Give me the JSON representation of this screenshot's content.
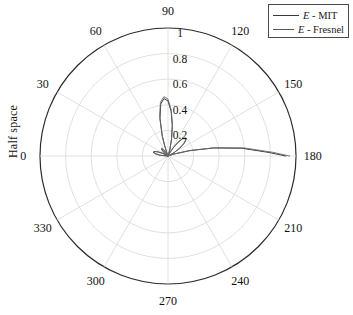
{
  "axes": {
    "ylabel": "Half space",
    "angle_ticks": [
      "0",
      "30",
      "60",
      "90",
      "120",
      "150",
      "180",
      "210",
      "240",
      "270",
      "300",
      "330"
    ],
    "radial_ticks": [
      "0.2",
      "0.4",
      "0.6",
      "0.8",
      "1"
    ]
  },
  "legend": {
    "items": [
      {
        "name": "E - MIT",
        "prefix": "E",
        "suffix": " - MIT",
        "color": "#3a3a3a"
      },
      {
        "name": "E - Fresnel",
        "prefix": "E",
        "suffix": " - Fresnel",
        "color": "#555555"
      }
    ]
  },
  "colors": {
    "outer_circle": "#2a2a2a",
    "grid": "#d8d8d8",
    "curve_mit": "#3a3a3a",
    "curve_fresnel": "#6a6a6a",
    "text": "#111111",
    "background": "#ffffff"
  },
  "chart_data": {
    "type": "line",
    "coordinate_system": "polar",
    "title": "",
    "xlabel": "",
    "ylabel": "Half space",
    "rlim": [
      0,
      1
    ],
    "r_ticks": [
      0.2,
      0.4,
      0.6,
      0.8,
      1.0
    ],
    "theta_ticks_deg": [
      0,
      30,
      60,
      90,
      120,
      150,
      180,
      210,
      240,
      270,
      300,
      330
    ],
    "theta_direction": "counterclockwise",
    "theta_zero_location": "W",
    "grid": true,
    "legend_position": "top-right",
    "series": [
      {
        "name": "E - MIT",
        "color": "#3a3a3a",
        "theta_deg": [
          0,
          5,
          10,
          14,
          18,
          22,
          26,
          30,
          34,
          38,
          42,
          46,
          50,
          54,
          58,
          62,
          66,
          70,
          72,
          74,
          78,
          82,
          86,
          90,
          94,
          98,
          102,
          106,
          110,
          114,
          118,
          122,
          126,
          130,
          134,
          138,
          142,
          146,
          150,
          154,
          158,
          160,
          162,
          166,
          170,
          174,
          178,
          180
        ],
        "r": [
          0.0,
          0.06,
          0.1,
          0.12,
          0.115,
          0.09,
          0.05,
          0.015,
          0.0,
          0.02,
          0.05,
          0.07,
          0.075,
          0.06,
          0.035,
          0.01,
          0.0,
          0.03,
          0.08,
          0.16,
          0.3,
          0.41,
          0.45,
          0.43,
          0.35,
          0.24,
          0.13,
          0.05,
          0.01,
          0.0,
          0.02,
          0.07,
          0.13,
          0.175,
          0.19,
          0.185,
          0.155,
          0.11,
          0.06,
          0.02,
          0.0,
          0.01,
          0.05,
          0.17,
          0.36,
          0.58,
          0.79,
          0.92
        ]
      },
      {
        "name": "E - Fresnel",
        "color": "#6a6a6a",
        "theta_deg": [
          0,
          5,
          10,
          14,
          18,
          22,
          26,
          30,
          34,
          38,
          42,
          46,
          50,
          54,
          58,
          62,
          66,
          70,
          72,
          74,
          78,
          82,
          86,
          90,
          94,
          98,
          102,
          106,
          110,
          114,
          118,
          122,
          126,
          130,
          134,
          138,
          142,
          146,
          150,
          154,
          158,
          160,
          162,
          166,
          170,
          174,
          178,
          180
        ],
        "r": [
          0.0,
          0.055,
          0.095,
          0.115,
          0.11,
          0.085,
          0.048,
          0.012,
          0.0,
          0.022,
          0.052,
          0.072,
          0.078,
          0.062,
          0.036,
          0.012,
          0.0,
          0.032,
          0.085,
          0.17,
          0.315,
          0.425,
          0.465,
          0.445,
          0.36,
          0.25,
          0.135,
          0.052,
          0.012,
          0.0,
          0.022,
          0.075,
          0.135,
          0.18,
          0.198,
          0.192,
          0.16,
          0.115,
          0.062,
          0.022,
          0.0,
          0.012,
          0.055,
          0.18,
          0.375,
          0.6,
          0.82,
          0.95
        ]
      }
    ],
    "annotations": [
      {
        "text": "main lobe peak near 180 deg at r ~ 0.95"
      },
      {
        "text": "secondary lobe near 86 deg at r ~ 0.46"
      }
    ]
  }
}
